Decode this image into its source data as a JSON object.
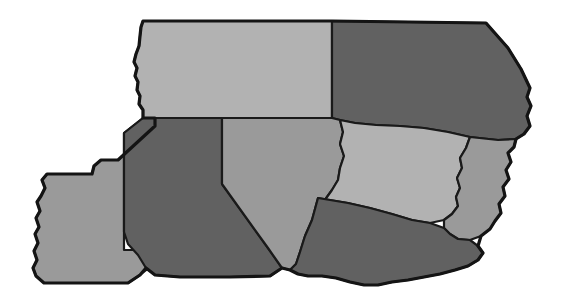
{
  "figure": {
    "type": "map",
    "background_color": "#ffffff",
    "border_color": "#141414",
    "width": 570,
    "height": 306
  },
  "legend_shades": {
    "light": "#b2b2b2",
    "medium": "#9a9a9a",
    "dark": "#616161"
  },
  "regions": [
    {
      "id": "region-north-west",
      "name": "north-west-region",
      "shade_label": "light",
      "fill": "#b2b2b2",
      "path": "M 143 21 L 332 21 L 332 118 L 143 118 L 143 110 L 139 104 L 140 96 L 137 90 L 138 82 L 135 76 L 137 68 L 134 62 L 136 54 L 139 46 L 140 36 L 141 27 Z"
    },
    {
      "id": "region-north-east",
      "name": "north-east-region",
      "shade_label": "dark",
      "fill": "#616161",
      "path": "M 332 21 L 486 23 L 508 48 L 521 69 L 530 88 L 527 97 L 531 106 L 527 116 L 530 126 L 524 134 L 516 139 L 498 140 L 470 137 L 448 132 L 424 128 L 400 126 L 376 125 L 355 123 L 340 120 L 332 118 Z"
    },
    {
      "id": "region-west",
      "name": "west-region",
      "shade_label": "medium",
      "fill": "#9a9a9a",
      "path": "M 143 118 L 155 118 L 155 126 L 118 160 L 101 160 L 94 166 L 92 174 L 47 174 L 42 180 L 45 188 L 41 196 L 37 202 L 40 211 L 36 218 L 39 227 L 35 234 L 38 243 L 34 251 L 37 260 L 33 268 L 36 276 L 44 283 L 112 283 L 128 283 L 140 275 L 155 263 L 155 250 L 124 250 L 124 133 Z"
    },
    {
      "id": "region-central-west",
      "name": "central-west-region",
      "shade_label": "dark",
      "fill": "#616161",
      "path": "M 143 118 L 222 118 L 222 184 L 268 248 L 282 268 L 270 276 L 230 277 L 180 277 L 155 275 L 146 268 L 138 255 L 128 244 L 124 232 L 124 133 Z"
    },
    {
      "id": "region-central",
      "name": "central-region",
      "shade_label": "medium",
      "fill": "#9a9a9a",
      "path": "M 222 118 L 332 118 L 340 120 L 343 132 L 340 144 L 344 156 L 340 168 L 338 180 L 332 190 L 322 204 L 312 220 L 305 236 L 300 252 L 296 264 L 290 270 L 282 268 L 268 248 L 222 184 Z"
    },
    {
      "id": "region-east-central",
      "name": "east-central-region",
      "shade_label": "light",
      "fill": "#b2b2b2",
      "path": "M 340 120 L 355 123 L 376 125 L 400 126 L 424 128 L 448 132 L 470 137 L 466 148 L 460 158 L 462 168 L 457 178 L 460 188 L 456 197 L 458 206 L 452 214 L 444 220 L 430 223 L 412 220 L 392 214 L 370 208 L 348 203 L 330 200 L 318 198 L 312 220 L 322 204 L 332 190 L 338 180 L 340 168 L 344 156 L 340 144 L 343 132 Z"
    },
    {
      "id": "region-east-sliver",
      "name": "east-sliver-region",
      "shade_label": "medium",
      "fill": "#9a9a9a",
      "path": "M 470 137 L 498 140 L 516 139 L 514 147 L 508 153 L 511 162 L 506 170 L 509 179 L 503 187 L 505 196 L 499 204 L 501 213 L 495 221 L 490 229 L 481 236 L 470 240 L 458 239 L 450 234 L 444 228 L 444 220 L 452 214 L 458 206 L 456 197 L 460 188 L 457 178 L 462 168 L 460 158 L 466 148 Z"
    },
    {
      "id": "region-south",
      "name": "south-region",
      "shade_label": "dark",
      "fill": "#616161",
      "path": "M 318 198 L 330 200 L 348 203 L 370 208 L 392 214 L 412 220 L 430 223 L 444 228 L 450 234 L 458 239 L 470 240 L 478 246 L 483 253 L 478 260 L 468 266 L 455 270 L 440 274 L 424 277 L 408 280 L 392 282 L 378 285 L 364 285 L 350 282 L 336 278 L 322 276 L 308 276 L 298 274 L 290 270 L 296 264 L 300 252 L 305 236 L 312 220 Z"
    }
  ],
  "outer_border": {
    "name": "map-outline",
    "path": "M 143 21 L 332 21 L 486 23 L 508 48 L 521 69 L 530 88 L 527 97 L 531 106 L 527 116 L 530 126 L 524 134 L 516 139 L 514 147 L 508 153 L 511 162 L 506 170 L 509 179 L 503 187 L 505 196 L 499 204 L 501 213 L 495 221 L 490 229 L 481 236 L 478 246 L 483 253 L 478 260 L 468 266 L 455 270 L 440 274 L 424 277 L 408 280 L 392 282 L 378 285 L 364 285 L 350 282 L 336 278 L 322 276 L 308 276 L 298 274 L 290 270 L 282 268 L 270 276 L 230 277 L 180 277 L 155 275 L 146 268 L 140 275 L 128 283 L 112 283 L 44 283 L 36 276 L 33 268 L 37 260 L 34 251 L 38 243 L 35 234 L 39 227 L 36 218 L 40 211 L 37 202 L 41 196 L 45 188 L 42 180 L 47 174 L 92 174 L 94 166 L 101 160 L 118 160 L 155 126 L 155 118 L 143 118 L 143 110 L 139 104 L 140 96 L 137 90 L 138 82 L 135 76 L 137 68 L 134 62 L 136 54 L 139 46 L 140 36 L 141 27 Z"
  }
}
